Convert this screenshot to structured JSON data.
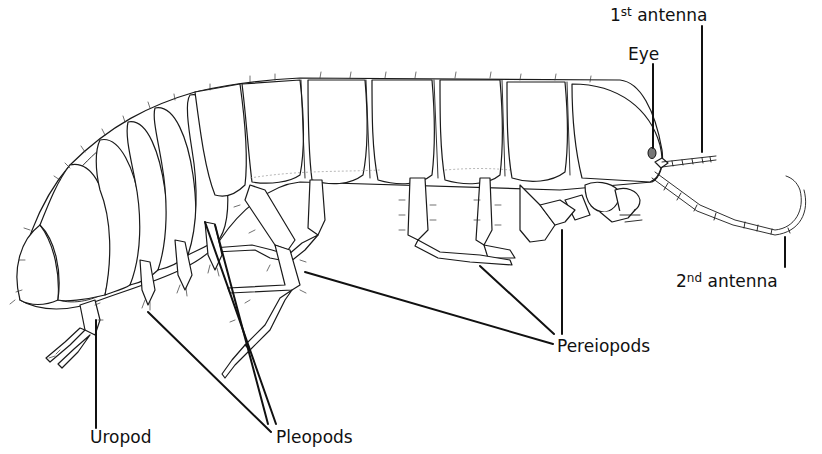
{
  "figure": {
    "colors": {
      "ink": "#111111",
      "background": "#ffffff"
    }
  },
  "labels": {
    "antenna1": {
      "prefix": "1",
      "sup": "st",
      "text": " antenna"
    },
    "eye": {
      "text": "Eye"
    },
    "antenna2": {
      "prefix": "2",
      "sup": "nd",
      "text": " antenna"
    },
    "pereiopods": {
      "text": "Pereiopods"
    },
    "uropod": {
      "text": "Uropod"
    },
    "pleopods": {
      "text": "Pleopods"
    }
  }
}
